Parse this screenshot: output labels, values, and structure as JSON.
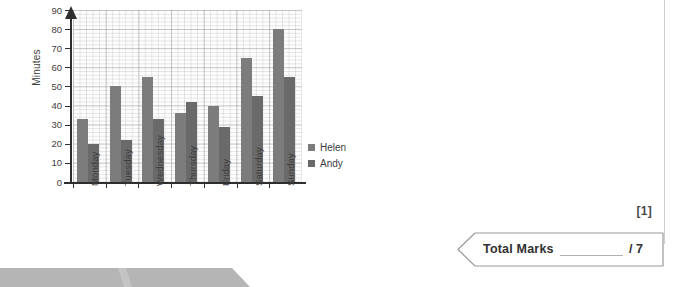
{
  "chart_data": {
    "type": "bar",
    "title": "",
    "xlabel": "",
    "ylabel": "Minutes",
    "categories": [
      "Monday",
      "Tuesday",
      "Wednesday",
      "Thursday",
      "Friday",
      "Saturday",
      "Sunday"
    ],
    "series": [
      {
        "name": "Helen",
        "color": "#7c7c7c",
        "values": [
          33,
          50,
          55,
          36,
          40,
          65,
          80
        ]
      },
      {
        "name": "Andy",
        "color": "#6a6a6a",
        "values": [
          20,
          22,
          33,
          42,
          29,
          45,
          55
        ]
      }
    ],
    "ylim": [
      0,
      90
    ],
    "ytick_labels": [
      "0",
      "10",
      "20",
      "30",
      "40",
      "50",
      "60",
      "70",
      "80",
      "90"
    ],
    "ytick_values": [
      0,
      10,
      20,
      30,
      40,
      50,
      60,
      70,
      80,
      90
    ],
    "grid": true,
    "grid_style": "graph-paper",
    "legend_position": "right"
  },
  "legend": {
    "items": [
      {
        "label": "Helen",
        "color": "#7c7c7c"
      },
      {
        "label": "Andy",
        "color": "#6a6a6a"
      }
    ]
  },
  "marks": {
    "question_marks": "[1]",
    "total_label": "Total Marks",
    "total_out_of": "/ 7"
  },
  "colors": {
    "axis": "#2e2e2e",
    "grid_major": "#969696",
    "grid_minor": "#afafaf",
    "text": "#3d3d3d",
    "banner_outline": "#9a9a9a",
    "footer_bar": "#b5b5b5"
  }
}
